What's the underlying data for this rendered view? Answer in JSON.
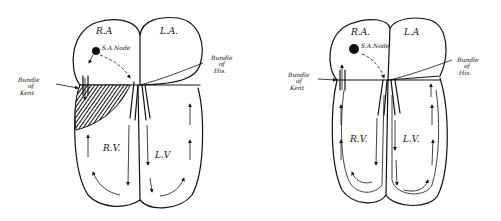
{
  "diagrams": [
    {
      "id": "left",
      "labels": {
        "right_atrium": "R.A",
        "left_atrium": "L.A.",
        "sa_node": "S.A.Node",
        "right_ventricle": "R.V.",
        "left_ventricle": "L.V",
        "bundle_kent": [
          "Bundle",
          "of",
          "Kent"
        ],
        "bundle_his": [
          "Bundle",
          "of",
          "His."
        ]
      }
    },
    {
      "id": "right",
      "labels": {
        "right_atrium": "R.A.",
        "left_atrium": "L.A",
        "sa_node": "S.A.Node",
        "right_ventricle": "R.V.",
        "left_ventricle": "L.V.",
        "bundle_kent": [
          "Bundle",
          "of",
          "Kent"
        ],
        "bundle_his": [
          "Bundle",
          "of",
          "His."
        ]
      }
    }
  ],
  "colors": {
    "ink": "#111111",
    "background": "#ffffff"
  }
}
